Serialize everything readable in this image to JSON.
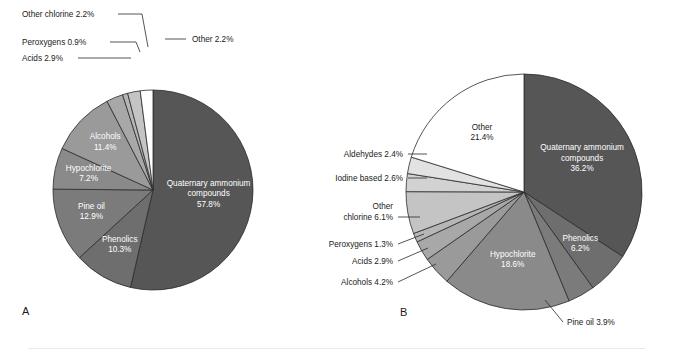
{
  "figure": {
    "background": "#ffffff",
    "rule_color": "#e9e9e9",
    "slice_stroke": "#2b2b2b"
  },
  "palette": {
    "quaternary": "#565656",
    "phenolics": "#6e6e6e",
    "pine_oil": "#7b7b7b",
    "hypochlorite": "#8a8a8a",
    "alcohols": "#9a9a9a",
    "acids": "#a8a8a8",
    "peroxygens": "#b6b6b6",
    "other_chlorine": "#c4c4c4",
    "iodine": "#d2d2d2",
    "aldehydes": "#e2e2e2",
    "other": "#ffffff"
  },
  "chart_data": [
    {
      "type": "pie",
      "id": "A",
      "panel_label": "A",
      "title": "",
      "start_angle_deg": 0,
      "direction": "clockwise",
      "center": [
        153,
        190
      ],
      "radius": 100,
      "total": 100.0,
      "categories": [
        "Quaternary ammonium compounds",
        "Phenolics",
        "Pine oil",
        "Hypochlorite",
        "Alcohols",
        "Acids",
        "Peroxygens",
        "Other chlorine",
        "Other"
      ],
      "values": [
        57.8,
        10.3,
        12.9,
        7.2,
        11.4,
        2.9,
        0.9,
        2.2,
        2.2
      ],
      "slices": [
        {
          "name": "Quaternary ammonium compounds",
          "value": 57.8,
          "label": "Quaternary ammonium compounds",
          "value_label": "57.8%",
          "color_key": "quaternary",
          "placement": "inside",
          "text_color": "light"
        },
        {
          "name": "Phenolics",
          "value": 10.3,
          "label": "Phenolics",
          "value_label": "10.3%",
          "color_key": "phenolics",
          "placement": "inside",
          "text_color": "light"
        },
        {
          "name": "Pine oil",
          "value": 12.9,
          "label": "Pine oil",
          "value_label": "12.9%",
          "color_key": "pine_oil",
          "placement": "inside",
          "text_color": "light"
        },
        {
          "name": "Hypochlorite",
          "value": 7.2,
          "label": "Hypochlorite",
          "value_label": "7.2%",
          "color_key": "hypochlorite",
          "placement": "inside",
          "text_color": "light"
        },
        {
          "name": "Alcohols",
          "value": 11.4,
          "label": "Alcohols",
          "value_label": "11.4%",
          "color_key": "alcohols",
          "placement": "inside",
          "text_color": "light"
        },
        {
          "name": "Acids",
          "value": 2.9,
          "label": "Acids 2.9%",
          "value_label": "2.9%",
          "color_key": "acids",
          "placement": "leader"
        },
        {
          "name": "Peroxygens",
          "value": 0.9,
          "label": "Peroxygens 0.9%",
          "value_label": "0.9%",
          "color_key": "peroxygens",
          "placement": "leader"
        },
        {
          "name": "Other chlorine",
          "value": 2.2,
          "label": "Other chlorine 2.2%",
          "value_label": "2.2%",
          "color_key": "other_chlorine",
          "placement": "leader"
        },
        {
          "name": "Other",
          "value": 2.2,
          "label": "Other 2.2%",
          "value_label": "2.2%",
          "color_key": "other",
          "placement": "leader"
        }
      ],
      "callouts": [
        {
          "text": "Other chlorine 2.2%",
          "x": 22,
          "y": 17,
          "anchor": "start",
          "line": [
            [
              118,
              14
            ],
            [
              142,
              14
            ],
            [
              148,
              47
            ]
          ]
        },
        {
          "text": "Peroxygens 0.9%",
          "x": 22,
          "y": 45,
          "anchor": "start",
          "line": [
            [
              110,
              42
            ],
            [
              136,
              42
            ],
            [
              140,
              52
            ]
          ]
        },
        {
          "text": "Acids 2.9%",
          "x": 22,
          "y": 61,
          "anchor": "start",
          "line": [
            [
              78,
              58
            ],
            [
              128,
              58
            ],
            [
              131,
              58
            ]
          ]
        },
        {
          "text": "Other 2.2%",
          "x": 192,
          "y": 42,
          "anchor": "start",
          "line": [
            [
              165,
              39
            ],
            [
              186,
              39
            ]
          ]
        }
      ]
    },
    {
      "type": "pie",
      "id": "B",
      "panel_label": "B",
      "title": "",
      "start_angle_deg": 0,
      "direction": "clockwise",
      "center": [
        524,
        192
      ],
      "radius": 118,
      "total": 100.0,
      "categories": [
        "Quaternary ammonium compounds",
        "Phenolics",
        "Pine oil",
        "Hypochlorite",
        "Alcohols",
        "Acids",
        "Peroxygens",
        "Other chlorine",
        "Iodine based",
        "Aldehydes",
        "Other"
      ],
      "values": [
        36.2,
        6.2,
        3.9,
        18.6,
        4.2,
        2.9,
        1.3,
        6.1,
        2.6,
        2.4,
        21.4
      ],
      "slices": [
        {
          "name": "Quaternary ammonium compounds",
          "value": 36.2,
          "label": "Quaternary ammonium compounds",
          "value_label": "36.2%",
          "color_key": "quaternary",
          "placement": "inside",
          "text_color": "light"
        },
        {
          "name": "Phenolics",
          "value": 6.2,
          "label": "Phenolics",
          "value_label": "6.2%",
          "color_key": "phenolics",
          "placement": "inside",
          "text_color": "light"
        },
        {
          "name": "Pine oil",
          "value": 3.9,
          "label": "Pine oil 3.9%",
          "value_label": "3.9%",
          "color_key": "pine_oil",
          "placement": "leader"
        },
        {
          "name": "Hypochlorite",
          "value": 18.6,
          "label": "Hypochlorite",
          "value_label": "18.6%",
          "color_key": "hypochlorite",
          "placement": "inside",
          "text_color": "light"
        },
        {
          "name": "Alcohols",
          "value": 4.2,
          "label": "Alcohols 4.2%",
          "value_label": "4.2%",
          "color_key": "alcohols",
          "placement": "leader"
        },
        {
          "name": "Acids",
          "value": 2.9,
          "label": "Acids 2.9%",
          "value_label": "2.9%",
          "color_key": "acids",
          "placement": "leader"
        },
        {
          "name": "Peroxygens",
          "value": 1.3,
          "label": "Peroxygens 1.3%",
          "value_label": "1.3%",
          "color_key": "peroxygens",
          "placement": "leader"
        },
        {
          "name": "Other chlorine",
          "value": 6.1,
          "label": "Other chlorine 6.1%",
          "value_label": "6.1%",
          "color_key": "other_chlorine",
          "placement": "leader"
        },
        {
          "name": "Iodine based",
          "value": 2.6,
          "label": "Iodine based 2.6%",
          "value_label": "2.6%",
          "color_key": "iodine",
          "placement": "leader"
        },
        {
          "name": "Aldehydes",
          "value": 2.4,
          "label": "Aldehydes 2.4%",
          "value_label": "2.4%",
          "color_key": "aldehydes",
          "placement": "leader"
        },
        {
          "name": "Other",
          "value": 21.4,
          "label": "Other",
          "value_label": "21.4%",
          "color_key": "other",
          "placement": "inside",
          "text_color": "dark"
        }
      ],
      "callouts": [
        {
          "text": "Aldehydes 2.4%",
          "x": 403,
          "y": 157,
          "anchor": "end",
          "line": [
            [
              408,
              154
            ],
            [
              427,
              154
            ]
          ]
        },
        {
          "text": "Iodine based 2.6%",
          "x": 403,
          "y": 181,
          "anchor": "end",
          "line": [
            [
              408,
              178
            ],
            [
              427,
              178
            ]
          ]
        },
        {
          "text": "Other",
          "x": 393,
          "y": 209,
          "anchor": "end",
          "line": null
        },
        {
          "text": "chlorine 6.1%",
          "x": 393,
          "y": 220,
          "anchor": "end",
          "line": [
            [
              398,
              217
            ],
            [
              420,
              217
            ]
          ]
        },
        {
          "text": "Peroxygens 1.3%",
          "x": 393,
          "y": 247,
          "anchor": "end",
          "line": [
            [
              398,
              244
            ],
            [
              424,
              234
            ]
          ]
        },
        {
          "text": "Acids 2.9%",
          "x": 393,
          "y": 264,
          "anchor": "end",
          "line": [
            [
              398,
              261
            ],
            [
              428,
              248
            ]
          ]
        },
        {
          "text": "Alcohols 4.2%",
          "x": 393,
          "y": 285,
          "anchor": "end",
          "line": [
            [
              398,
              282
            ],
            [
              436,
              264
            ]
          ]
        },
        {
          "text": "Pine oil 3.9%",
          "x": 567,
          "y": 325,
          "anchor": "start",
          "line": [
            [
              563,
              322
            ],
            [
              545,
              300
            ]
          ]
        }
      ]
    }
  ],
  "panel_letters": [
    {
      "label": "A",
      "x": 22,
      "y": 315
    },
    {
      "label": "B",
      "x": 400,
      "y": 316
    }
  ]
}
